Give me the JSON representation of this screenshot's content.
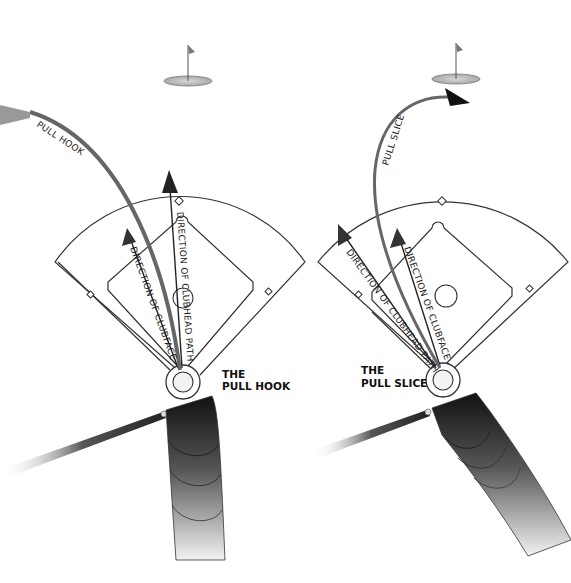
{
  "panels": [
    {
      "id": "pull-hook",
      "title_line1": "THE",
      "title_line2": "PULL HOOK",
      "flight_label": "PULL HOOK",
      "arrow_clubface": "DIRECTION OF CLUBFACE",
      "arrow_path": "DIRECTION OF CLUBHEAD PATH"
    },
    {
      "id": "pull-slice",
      "title_line1": "THE",
      "title_line2": "PULL SLICE",
      "flight_label": "PULL SLICE",
      "arrow_clubface": "DIRECTION OF CLUBFACE",
      "arrow_path": "DIRECTION OF CLUBHEAD PATH"
    }
  ],
  "colors": {
    "line": "#333333",
    "ball_path": "#6a6a6a",
    "arrow": "#1a1a1a",
    "green": "#b8b8b8"
  }
}
